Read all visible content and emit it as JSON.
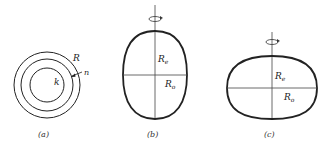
{
  "figure": {
    "panels": [
      {
        "id": "a",
        "caption": "(a)",
        "labels": {
          "outer": "R",
          "arrow": "n",
          "inner": "k"
        },
        "shapes": "three concentric circles"
      },
      {
        "id": "b",
        "caption": "(b)",
        "labels": {
          "equatorial": "R",
          "equatorial_sub": "e",
          "polar": "R",
          "polar_sub": "o"
        },
        "shapes": "prolate ellipse with rotation axis"
      },
      {
        "id": "c",
        "caption": "(c)",
        "labels": {
          "equatorial": "R",
          "equatorial_sub": "e",
          "polar": "R",
          "polar_sub": "o"
        },
        "shapes": "oblate ellipse with rotation axis"
      }
    ],
    "colors": {
      "stroke": "#222222",
      "background": "#ffffff"
    }
  }
}
